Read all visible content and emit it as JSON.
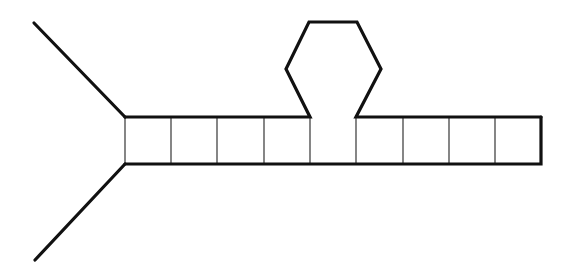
{
  "diagram": {
    "type": "ladder-with-hairpin-loop",
    "colors": {
      "stroke": "#111111",
      "background": "#ffffff"
    },
    "fork_arms": [
      {
        "from": [
          34,
          23
        ],
        "to": [
          125,
          117
        ]
      },
      {
        "from": [
          35,
          260
        ],
        "to": [
          125,
          164
        ]
      }
    ],
    "ladder": {
      "top_y": 117,
      "bottom_y": 164,
      "rungs_x": [
        125,
        171,
        217,
        264,
        310,
        356,
        403,
        449,
        495,
        541
      ],
      "cell_count": 9
    },
    "loop": {
      "shape": "hexagon",
      "points": [
        [
          310,
          117
        ],
        [
          286,
          69
        ],
        [
          309,
          22
        ],
        [
          357,
          22
        ],
        [
          381,
          69
        ],
        [
          356,
          117
        ]
      ]
    }
  }
}
